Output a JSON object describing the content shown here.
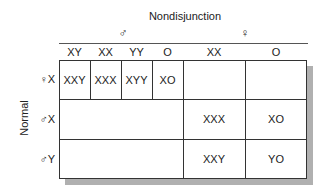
{
  "title": "Nondisjunction",
  "groups": {
    "male": {
      "symbol": "♂",
      "columns": [
        "XY",
        "XX",
        "YY",
        "O"
      ]
    },
    "female": {
      "symbol": "♀",
      "columns": [
        "XX",
        "O"
      ]
    }
  },
  "side_label": "Normal",
  "rows": [
    {
      "label": "♀X",
      "cells": [
        "XXY",
        "XXX",
        "XYY",
        "XO",
        "",
        ""
      ]
    },
    {
      "label": "♂X",
      "cells": [
        "",
        "XXX",
        "XO"
      ]
    },
    {
      "label": "♂Y",
      "cells": [
        "",
        "XXY",
        "YO"
      ]
    }
  ]
}
